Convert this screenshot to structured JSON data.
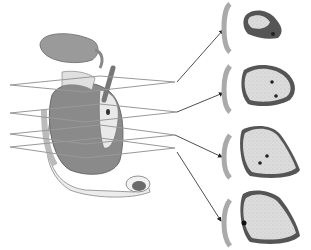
{
  "figure": {
    "type": "anatomical-illustration",
    "planes": 4,
    "cross_sections": 4,
    "colors": {
      "organ_light": "#e4e4e4",
      "organ_dark": "#7a7a7a",
      "tissue_fill": "#d8d8d8",
      "rim": "#555555",
      "line": "#222222"
    }
  }
}
